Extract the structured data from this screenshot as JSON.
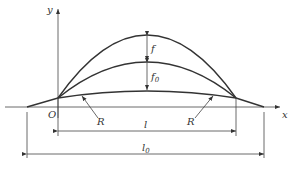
{
  "diagram": {
    "type": "arch-deflection-geometry",
    "axes": {
      "x_label": "x",
      "y_label": "y",
      "origin_label": "O"
    },
    "dimensions": {
      "rise_upper": "f",
      "rise_lower_main": "f",
      "rise_lower_sub": "0",
      "span_inner_main": "l",
      "span_outer_main": "l",
      "span_outer_sub": "0"
    },
    "radius_labels": {
      "left": "R",
      "right": "R"
    },
    "colors": {
      "line": "#333333",
      "background": "#ffffff"
    }
  }
}
